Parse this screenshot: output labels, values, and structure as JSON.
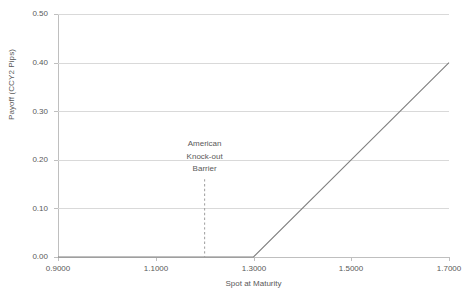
{
  "chart_data": {
    "type": "line",
    "title": "",
    "xlabel": "Spot at Maturity",
    "ylabel": "Payoff (CCY2 Pips)",
    "xlim": [
      0.9,
      1.7
    ],
    "ylim": [
      0.0,
      0.5
    ],
    "grid": true,
    "legend": "none",
    "x_ticks": [
      "0.9000",
      "1.1000",
      "1.3000",
      "1.5000",
      "1.7000"
    ],
    "x_tick_values": [
      0.9,
      1.1,
      1.3,
      1.5,
      1.7
    ],
    "y_ticks": [
      "0.00",
      "0.10",
      "0.20",
      "0.30",
      "0.40",
      "0.50"
    ],
    "y_tick_values": [
      0.0,
      0.1,
      0.2,
      0.3,
      0.4,
      0.5
    ],
    "series": [
      {
        "name": "Payoff",
        "color": "#808080",
        "x": [
          0.9,
          1.3,
          1.7
        ],
        "values": [
          0.0,
          0.0,
          0.4
        ]
      }
    ],
    "annotations": [
      {
        "name": "american-knock-out-barrier",
        "lines": [
          "American",
          "Knock-out",
          "Barrier"
        ],
        "text": "American Knock-out Barrier",
        "x": 1.2,
        "line_style": "dashed",
        "line_color": "#a6a6a6",
        "line_from_y": 0.16,
        "line_to_y": 0.0
      }
    ]
  },
  "axes": {
    "y_title": "Payoff (CCY2 Pips)",
    "x_title": "Spot at Maturity",
    "y_labels": [
      "0.50",
      "0.40",
      "0.30",
      "0.20",
      "0.10",
      "0.00"
    ],
    "x_labels": [
      "0.9000",
      "1.1000",
      "1.3000",
      "1.5000",
      "1.7000"
    ]
  },
  "annotation": {
    "line1": "American",
    "line2": "Knock-out",
    "line3": "Barrier"
  },
  "colors": {
    "series": "#808080",
    "gridline": "#d9d9d9",
    "axis": "#bfbfbf",
    "text": "#595959",
    "barrier": "#a6a6a6",
    "background": "#ffffff"
  }
}
